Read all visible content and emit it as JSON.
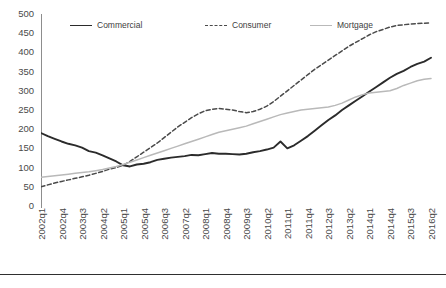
{
  "chart_data": {
    "type": "line",
    "title": "",
    "xlabel": "",
    "ylabel": "",
    "ylim": [
      0,
      500
    ],
    "ytick_step": 50,
    "grid": false,
    "legend_position": "top",
    "ytick_labels": [
      "500",
      "450",
      "400",
      "350",
      "300",
      "250",
      "200",
      "150",
      "100",
      "50",
      "0"
    ],
    "xtick_labels": [
      "2002q1",
      "2002q4",
      "2003q3",
      "2004q2",
      "2005q1",
      "2005q4",
      "2006q3",
      "2007q2",
      "2008q1",
      "2008q4",
      "2009q3",
      "2010q2",
      "2011q1",
      "2011q4",
      "2012q3",
      "2013q2",
      "2014q1",
      "2014q4",
      "2015q3",
      "2016q2"
    ],
    "x": [
      "2002q1",
      "2002q2",
      "2002q3",
      "2002q4",
      "2003q1",
      "2003q2",
      "2003q3",
      "2003q4",
      "2004q1",
      "2004q2",
      "2004q3",
      "2004q4",
      "2005q1",
      "2005q2",
      "2005q3",
      "2005q4",
      "2006q1",
      "2006q2",
      "2006q3",
      "2006q4",
      "2007q1",
      "2007q2",
      "2007q3",
      "2007q4",
      "2008q1",
      "2008q2",
      "2008q3",
      "2008q4",
      "2009q1",
      "2009q2",
      "2009q3",
      "2009q4",
      "2010q1",
      "2010q2",
      "2010q3",
      "2010q4",
      "2011q1",
      "2011q2",
      "2011q3",
      "2011q4",
      "2012q1",
      "2012q2",
      "2012q3",
      "2012q4",
      "2013q1",
      "2013q2",
      "2013q3",
      "2013q4",
      "2014q1",
      "2014q2",
      "2014q3",
      "2014q4",
      "2015q1",
      "2015q2",
      "2015q3",
      "2015q4",
      "2016q1",
      "2016q2"
    ],
    "series": [
      {
        "name": "Commercial",
        "style": "solid",
        "color": "#2b2b2b",
        "width": 1.9,
        "values": [
          190,
          182,
          175,
          168,
          162,
          158,
          152,
          143,
          139,
          132,
          124,
          116,
          106,
          103,
          108,
          110,
          114,
          120,
          123,
          126,
          128,
          130,
          133,
          132,
          135,
          138,
          136,
          136,
          135,
          134,
          136,
          140,
          143,
          147,
          152,
          168,
          150,
          158,
          170,
          182,
          196,
          210,
          224,
          236,
          250,
          262,
          274,
          286,
          298,
          310,
          322,
          334,
          344,
          352,
          362,
          370,
          376,
          386
        ]
      },
      {
        "name": "Consumer",
        "style": "dashed",
        "color": "#4a4a4a",
        "width": 1.5,
        "values": [
          50,
          55,
          60,
          64,
          68,
          72,
          76,
          80,
          85,
          90,
          96,
          100,
          106,
          116,
          128,
          140,
          152,
          164,
          178,
          192,
          206,
          218,
          230,
          240,
          248,
          252,
          254,
          252,
          250,
          246,
          243,
          246,
          252,
          260,
          272,
          286,
          300,
          314,
          328,
          342,
          356,
          368,
          380,
          392,
          404,
          416,
          426,
          436,
          446,
          454,
          460,
          466,
          470,
          472,
          474,
          475,
          476,
          477
        ]
      },
      {
        "name": "Mortgage",
        "style": "solid",
        "color": "#b9b9b9",
        "width": 1.5,
        "values": [
          75,
          77,
          79,
          81,
          83,
          85,
          87,
          89,
          92,
          95,
          99,
          103,
          108,
          114,
          120,
          126,
          132,
          138,
          144,
          150,
          156,
          162,
          168,
          174,
          180,
          186,
          192,
          196,
          200,
          204,
          208,
          214,
          220,
          226,
          232,
          238,
          242,
          246,
          250,
          252,
          254,
          256,
          258,
          262,
          268,
          276,
          284,
          290,
          294,
          296,
          298,
          300,
          306,
          314,
          320,
          326,
          330,
          332
        ]
      }
    ]
  }
}
